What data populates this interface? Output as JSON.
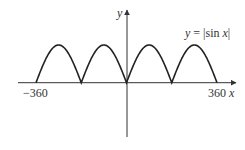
{
  "chart_data": {
    "type": "line",
    "title": "",
    "function_label": "y = |sin x|",
    "function_label_parts": {
      "lhs": "y",
      "eq": " = |sin ",
      "var": "x",
      "close": "|"
    },
    "xlabel": "x",
    "ylabel": "y",
    "xlim": [
      -360,
      360
    ],
    "ylim": [
      0,
      1
    ],
    "x_ticks": [
      -360,
      360
    ],
    "x_tick_labels": [
      "−360",
      "360"
    ],
    "grid": false,
    "legend": "none",
    "series": [
      {
        "name": "y = |sin x|",
        "x": [
          -360,
          -315,
          -270,
          -225,
          -180,
          -135,
          -90,
          -45,
          0,
          45,
          90,
          135,
          180,
          225,
          270,
          315,
          360
        ],
        "values": [
          0,
          0.707,
          1,
          0.707,
          0,
          0.707,
          1,
          0.707,
          0,
          0.707,
          1,
          0.707,
          0,
          0.707,
          1,
          0.707,
          0
        ]
      }
    ]
  },
  "style": {
    "axis_color": "#333333",
    "curve_color": "#222222",
    "background": "#ffffff"
  }
}
